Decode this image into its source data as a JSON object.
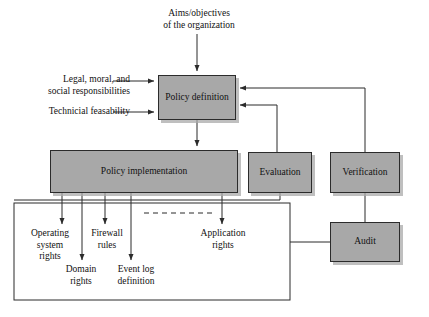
{
  "diagram": {
    "colors": {
      "node_fill": "#a8a8a8",
      "node_border": "#2b2b2b",
      "edge": "#2b2b2b",
      "text": "#111111",
      "background": "#ffffff",
      "shadow": "#aaaaaa"
    },
    "nodes": {
      "policy_definition": "Policy\ndefinition",
      "policy_implementation": "Policy\nimplementation",
      "evaluation": "Evaluation",
      "verification": "Verification",
      "audit": "Audit"
    },
    "labels": {
      "aims": "Aims/objectives\nof the organization",
      "legal": "Legal, moral, and\nsocial responsibilities",
      "technical": "Technicial feasability",
      "operating_system_rights": "Operating\nsystem\nrights",
      "domain_rights": "Domain\nrights",
      "firewall_rules": "Firewall\nrules",
      "event_log_definition": "Event log\ndefinition",
      "application_rights": "Application\nrights"
    },
    "edges": [
      {
        "from": "aims",
        "to": "policy_definition",
        "style": "arrow"
      },
      {
        "from": "legal",
        "to": "policy_definition",
        "style": "arrow"
      },
      {
        "from": "technical",
        "to": "policy_definition",
        "style": "arrow"
      },
      {
        "from": "policy_definition",
        "to": "policy_implementation",
        "style": "arrow"
      },
      {
        "from": "evaluation",
        "to": "policy_definition",
        "style": "arrow-feedback"
      },
      {
        "from": "verification",
        "to": "policy_definition",
        "style": "arrow-feedback"
      },
      {
        "from": "policy_implementation",
        "to": "operating_system_rights",
        "style": "arrow"
      },
      {
        "from": "policy_implementation",
        "to": "domain_rights",
        "style": "arrow"
      },
      {
        "from": "policy_implementation",
        "to": "firewall_rules",
        "style": "arrow"
      },
      {
        "from": "policy_implementation",
        "to": "event_log_definition",
        "style": "arrow"
      },
      {
        "from": "policy_implementation",
        "to": "application_rights",
        "style": "arrow"
      },
      {
        "from": "policy_implementation",
        "to": "evaluation",
        "style": "line"
      },
      {
        "from": "verification",
        "to": "audit",
        "style": "line"
      },
      {
        "from": "audit",
        "to": "implementation_group",
        "style": "line"
      }
    ],
    "decorations": {
      "dashed_separator": "dashed-line",
      "group_boundary": "implementation-group-rectangle"
    }
  }
}
